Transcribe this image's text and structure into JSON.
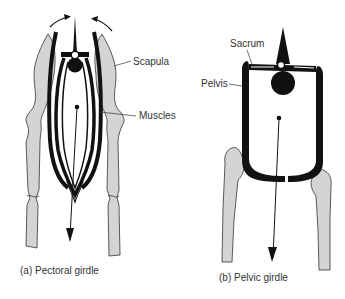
{
  "figure": {
    "panels": [
      {
        "id": "a",
        "caption": "(a) Pectoral girdle",
        "labels": {
          "scapula": "Scapula",
          "muscles": "Muscles"
        }
      },
      {
        "id": "b",
        "caption": "(b) Pelvic girdle",
        "labels": {
          "sacrum": "Sacrum",
          "pelvis": "Pelvis"
        }
      }
    ],
    "colors": {
      "bone": "#d4d4d4",
      "outline": "#333333",
      "ink": "#111111",
      "text": "#333333"
    }
  }
}
